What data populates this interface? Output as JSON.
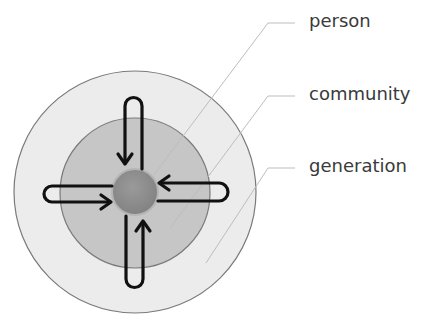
{
  "diagram": {
    "labels": {
      "person": "person",
      "community": "community",
      "generation": "generation"
    },
    "colors": {
      "generation_fill": "#ececec",
      "community_fill": "#c6c6c6",
      "person_fill": "#8f8f8f",
      "ring_stroke": "#7a7a7a",
      "arrow": "#111111",
      "leader": "#bdbdbd",
      "label_text": "#3a3a3a"
    },
    "structure": "Three concentric circles (person inside community inside generation) with four looped arrows flowing inward to the person from each direction"
  }
}
